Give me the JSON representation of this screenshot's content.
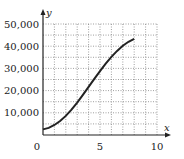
{
  "chart_data": {
    "type": "line",
    "title": "",
    "xlabel": "x",
    "ylabel": "y",
    "xlim": [
      0,
      10
    ],
    "ylim": [
      0,
      50000
    ],
    "grid": true,
    "grid_style": "dotted",
    "x_ticks": [
      0,
      5,
      10
    ],
    "x_tick_labels": [
      "0",
      "5",
      "10"
    ],
    "y_ticks": [
      10000,
      20000,
      30000,
      40000,
      50000
    ],
    "y_tick_labels": [
      "10,000",
      "20,000",
      "30,000",
      "40,000",
      "50,000"
    ],
    "legend": null,
    "series": [
      {
        "name": "curve",
        "x": [
          0,
          0.5,
          1,
          1.5,
          2,
          2.5,
          3,
          3.5,
          4,
          4.5,
          5,
          5.5,
          6,
          6.5,
          7,
          7.5,
          8
        ],
        "y": [
          2500,
          3200,
          4500,
          6300,
          8600,
          11400,
          14600,
          18100,
          21700,
          25300,
          28800,
          32100,
          35200,
          37900,
          40200,
          42000,
          43300
        ]
      }
    ]
  },
  "labels": {
    "origin": "0",
    "x_axis": "x",
    "y_axis": "y"
  }
}
